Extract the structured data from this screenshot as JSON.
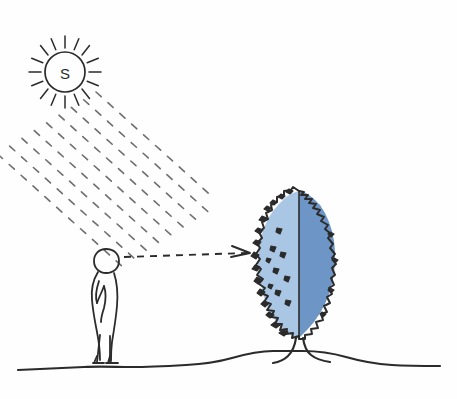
{
  "diagram": {
    "title": "Solar orientation sketch: observer viewing a tree lit from upper left",
    "background_color": "#fefefe",
    "ink_color": "#2b2b2b",
    "ray_color": "#6e6e6e"
  },
  "sun": {
    "label": "S",
    "name": "sun-symbol",
    "center_x": 65,
    "center_y": 72,
    "radius": 20,
    "ray_count": 16,
    "ray_inner": 24,
    "ray_outer": 36
  },
  "sun_beam": {
    "name": "sunlight-beam",
    "description": "Band of short parallel dashes travelling from the sun down to the tree crown",
    "angle_degrees": 42,
    "dash_rows": 9,
    "dash_columns": 11,
    "start_x": 96,
    "start_y": 92,
    "color": "#6e6e6e"
  },
  "sight_line": {
    "name": "view-direction-arrow",
    "description": "Horizontal dashed arrow from the person's eye level to the tree",
    "from_x": 124,
    "from_y": 256,
    "to_x": 252,
    "to_y": 254,
    "dash_pattern": "7 6",
    "color": "#2b2b2b"
  },
  "person": {
    "name": "observer-figure",
    "description": "Outline of a standing person in profile facing right",
    "head_center_x": 106,
    "head_center_y": 262,
    "ground_y": 362,
    "height_px": 108
  },
  "tree": {
    "name": "tree-figure",
    "description": "Columnar tree with jagged foliage outline, split into a light sunlit-side and a darker shaded-side",
    "crown_top_y": 190,
    "crown_bottom_y": 336,
    "crown_left_x": 255,
    "crown_right_x": 337,
    "split_x": 300,
    "light_side_color": "#a9c6e4",
    "dark_side_color": "#6d95c6",
    "outline_color": "#2b2b2b",
    "trunk_base_x": 299,
    "trunk_base_y": 356
  },
  "ground": {
    "name": "ground-line",
    "description": "Hand drawn ground line rising into a low mound beneath the tree",
    "left_x": 18,
    "right_x": 440,
    "base_y": 368,
    "mound_peak_y": 354,
    "color": "#2b2b2b"
  }
}
